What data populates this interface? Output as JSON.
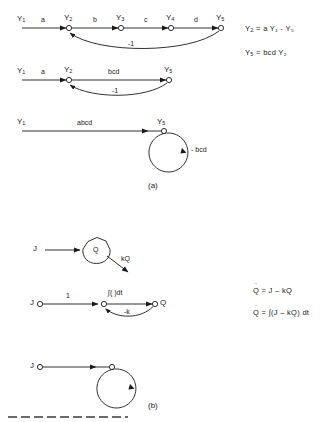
{
  "figure": {
    "panel_a": {
      "label": "(a)",
      "rows": [
        {
          "name": "row-1-expanded-graph",
          "nodes": [
            {
              "var": "Y",
              "sub": "1"
            },
            {
              "var": "Y",
              "sub": "2"
            },
            {
              "var": "Y",
              "sub": "3"
            },
            {
              "var": "Y",
              "sub": "4"
            },
            {
              "var": "Y",
              "sub": "5"
            }
          ],
          "forward_labels": [
            "a",
            "b",
            "c",
            "d"
          ],
          "feedback_label": "-1"
        },
        {
          "name": "row-2-partially-reduced-graph",
          "nodes": [
            {
              "var": "Y",
              "sub": "1"
            },
            {
              "var": "Y",
              "sub": "2"
            },
            {
              "var": "Y",
              "sub": "5"
            }
          ],
          "forward_labels": [
            "a",
            "bcd"
          ],
          "feedback_label": "-1"
        },
        {
          "name": "row-3-self-loop-graph",
          "nodes": [
            {
              "var": "Y",
              "sub": "1"
            },
            {
              "var": "Y",
              "sub": "5"
            }
          ],
          "forward_labels": [
            "abcd"
          ],
          "self_loop_label": "- bcd"
        }
      ],
      "equations": [
        "Y₂ = a Y₁ - Y₅",
        "Y₅ = bcd Y₂"
      ],
      "equations_parts": [
        {
          "lhs_var": "Y",
          "lhs_sub": "2",
          "rhs": "= a Y₁ - Y₅"
        },
        {
          "lhs_var": "Y",
          "lhs_sub": "5",
          "rhs": "= bcd Y₂"
        }
      ]
    },
    "panel_b": {
      "label": "(b)",
      "rows": [
        {
          "name": "row-1-reservoir",
          "inflow_label": "J",
          "store_label": "Q",
          "outflow_label": "kQ"
        },
        {
          "name": "row-2-integrator-graph",
          "source_label": "J",
          "sink_label": "Q",
          "forward_labels": [
            "1",
            "∫( )dt"
          ],
          "feedback_label": "-k"
        },
        {
          "name": "row-3-self-loop-graph",
          "source_label": "J"
        }
      ],
      "equations": [
        "Q̇ = J – kQ",
        "Q̇ = ∫(J – kQ) dt"
      ],
      "equations_parts": [
        {
          "lhs": "Q",
          "dot": true,
          "rhs": "= J – kQ"
        },
        {
          "lhs": "Q",
          "dot": true,
          "rhs": "= ∫(J – kQ) dt"
        }
      ]
    }
  },
  "colors": {
    "ink": "#1a1a1a",
    "paper": "#ffffff",
    "caption": "#333333"
  }
}
